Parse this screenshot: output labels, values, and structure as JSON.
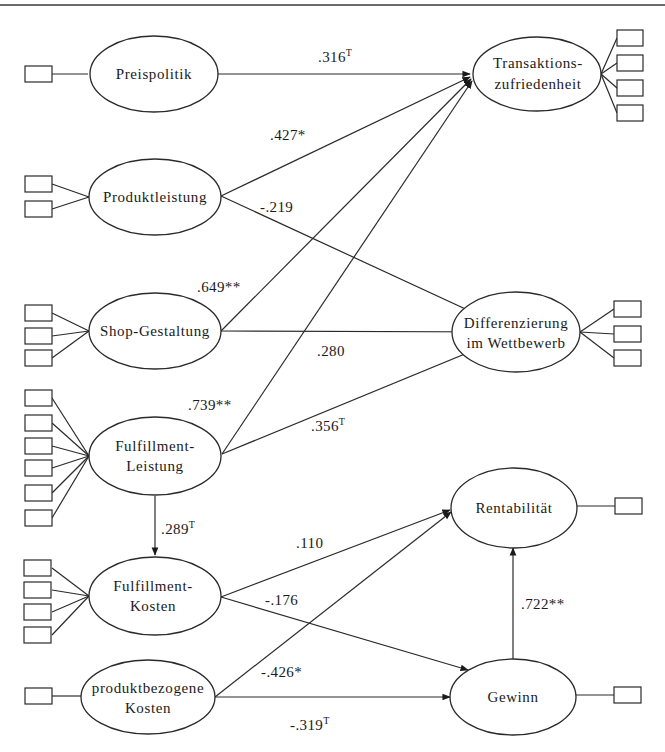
{
  "diagram": {
    "type": "structural-equation-model",
    "constructs": [
      {
        "id": "preispolitik",
        "label_lines": [
          "Preispolitik"
        ],
        "indicators": 1
      },
      {
        "id": "produktleistung",
        "label_lines": [
          "Produktleistung"
        ],
        "indicators": 2
      },
      {
        "id": "shop_gestaltung",
        "label_lines": [
          "Shop-Gestaltung"
        ],
        "indicators": 3
      },
      {
        "id": "fulfillment_leistung",
        "label_lines": [
          "Fulfillment-",
          "Leistung"
        ],
        "indicators": 6
      },
      {
        "id": "fulfillment_kosten",
        "label_lines": [
          "Fulfillment-",
          "Kosten"
        ],
        "indicators": 4
      },
      {
        "id": "produktbezogene_kosten",
        "label_lines": [
          "produktbezogene",
          "Kosten"
        ],
        "indicators": 1
      },
      {
        "id": "transaktionszufriedenheit",
        "label_lines": [
          "Transaktions-",
          "zufriedenheit"
        ],
        "indicators": 4
      },
      {
        "id": "differenzierung",
        "label_lines": [
          "Differenzierung",
          "im Wettbewerb"
        ],
        "indicators": 3
      },
      {
        "id": "rentabilitaet",
        "label_lines": [
          "Rentabilität"
        ],
        "indicators": 1
      },
      {
        "id": "gewinn",
        "label_lines": [
          "Gewinn"
        ],
        "indicators": 1
      }
    ],
    "paths": [
      {
        "from": "preispolitik",
        "to": "transaktionszufriedenheit",
        "value": ".316",
        "sig": "T"
      },
      {
        "from": "produktleistung",
        "to": "transaktionszufriedenheit",
        "value": ".427",
        "sig": "*"
      },
      {
        "from": "produktleistung",
        "to": "differenzierung",
        "value": "-.219",
        "sig": ""
      },
      {
        "from": "shop_gestaltung",
        "to": "transaktionszufriedenheit",
        "value": ".649",
        "sig": "**"
      },
      {
        "from": "shop_gestaltung",
        "to": "differenzierung",
        "value": ".280",
        "sig": ""
      },
      {
        "from": "fulfillment_leistung",
        "to": "transaktionszufriedenheit",
        "value": ".739",
        "sig": "**"
      },
      {
        "from": "fulfillment_leistung",
        "to": "differenzierung",
        "value": ".356",
        "sig": "T"
      },
      {
        "from": "fulfillment_leistung",
        "to": "fulfillment_kosten",
        "value": ".289",
        "sig": "T"
      },
      {
        "from": "fulfillment_kosten",
        "to": "rentabilitaet",
        "value": ".110",
        "sig": ""
      },
      {
        "from": "fulfillment_kosten",
        "to": "gewinn",
        "value": "-.176",
        "sig": ""
      },
      {
        "from": "produktbezogene_kosten",
        "to": "rentabilitaet",
        "value": "-.426",
        "sig": "*"
      },
      {
        "from": "produktbezogene_kosten",
        "to": "gewinn",
        "value": "-.319",
        "sig": "T"
      },
      {
        "from": "gewinn",
        "to": "rentabilitaet",
        "value": ".722",
        "sig": "**"
      }
    ]
  },
  "labels": {
    "preispolitik": "Preispolitik",
    "produktleistung": "Produktleistung",
    "shop_gestaltung": "Shop-Gestaltung",
    "fulfillment_leistung_1": "Fulfillment-",
    "fulfillment_leistung_2": "Leistung",
    "fulfillment_kosten_1": "Fulfillment-",
    "fulfillment_kosten_2": "Kosten",
    "produktbezogene_kosten_1": "produktbezogene",
    "produktbezogene_kosten_2": "Kosten",
    "transaktion_1": "Transaktions-",
    "transaktion_2": "zufriedenheit",
    "differenzierung_1": "Differenzierung",
    "differenzierung_2": "im Wettbewerb",
    "rentabilitaet": "Rentabilität",
    "gewinn": "Gewinn"
  },
  "coefficients": {
    "p316": ".316",
    "p316_sig": "T",
    "p427": ".427",
    "p427_sig": "*",
    "n219": "-.219",
    "p649": ".649",
    "p649_sig": "**",
    "p280": ".280",
    "p739": ".739",
    "p739_sig": "**",
    "p356": ".356",
    "p356_sig": "T",
    "p289": ".289",
    "p289_sig": "T",
    "p110": ".110",
    "n176": "-.176",
    "n426": "-.426",
    "n426_sig": "*",
    "n319": "-.319",
    "n319_sig": "T",
    "p722": ".722",
    "p722_sig": "**"
  }
}
